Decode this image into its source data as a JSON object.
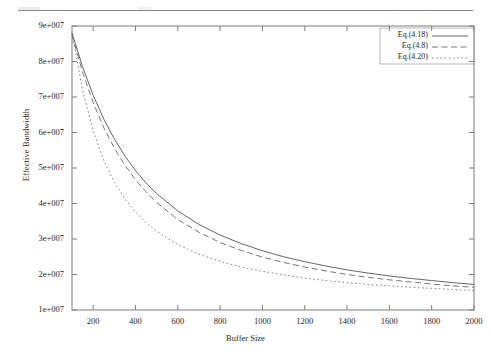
{
  "page": {
    "header_rule": "horizontal-rule"
  },
  "chart_data": {
    "type": "line",
    "title": "",
    "xlabel": "Buffer Size",
    "ylabel": "Effective Bandwidth",
    "xlim": [
      100,
      2000
    ],
    "ylim": [
      10000000,
      90000000
    ],
    "grid": false,
    "legend_position": "top-right",
    "xticks": [
      200,
      400,
      600,
      800,
      1000,
      1200,
      1400,
      1600,
      1800,
      2000
    ],
    "xticklabels": [
      "200",
      "400",
      "600",
      "800",
      "1000",
      "1200",
      "1400",
      "1600",
      "1800",
      "2000"
    ],
    "yticks": [
      10000000,
      20000000,
      30000000,
      40000000,
      50000000,
      60000000,
      70000000,
      80000000,
      90000000
    ],
    "yticklabels": [
      "1e+007",
      "2e+007",
      "3e+007",
      "4e+007",
      "5e+007",
      "6e+007",
      "7e+007",
      "8e+007",
      "9e+007"
    ],
    "x": [
      100,
      150,
      200,
      250,
      300,
      350,
      400,
      450,
      500,
      600,
      700,
      800,
      900,
      1000,
      1100,
      1200,
      1300,
      1400,
      1500,
      1600,
      1700,
      1800,
      1900,
      2000
    ],
    "series": [
      {
        "name": "Eq.(4.18)",
        "style": "solid",
        "color": "#555555",
        "values": [
          88000000,
          78500000,
          70500000,
          63800000,
          58200000,
          53400000,
          49300000,
          45800000,
          42800000,
          37900000,
          34100000,
          31100000,
          28700000,
          26700000,
          25000000,
          23600000,
          22400000,
          21300000,
          20400000,
          19600000,
          18900000,
          18300000,
          17700000,
          17200000
        ]
      },
      {
        "name": "Eq.(4.8)",
        "style": "dashed",
        "color": "#666666",
        "values": [
          87500000,
          77000000,
          68400000,
          61400000,
          55600000,
          50800000,
          46700000,
          43300000,
          40300000,
          35500000,
          31900000,
          29000000,
          26800000,
          24900000,
          23400000,
          22100000,
          21000000,
          20000000,
          19200000,
          18500000,
          17900000,
          17300000,
          16800000,
          16400000
        ]
      },
      {
        "name": "Eq.(4.20)",
        "style": "dotted",
        "color": "#777777",
        "values": [
          88000000,
          72000000,
          60500000,
          52200000,
          46000000,
          41300000,
          37600000,
          34600000,
          32200000,
          28400000,
          25700000,
          23700000,
          22100000,
          20900000,
          19900000,
          19000000,
          18300000,
          17700000,
          17200000,
          16800000,
          16400000,
          16100000,
          15800000,
          15500000
        ]
      }
    ]
  }
}
